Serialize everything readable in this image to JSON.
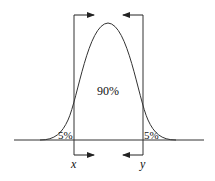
{
  "diagram": {
    "type": "normal-distribution-interval",
    "center_label": "90%",
    "left_tail_label": "5%",
    "right_tail_label": "5%",
    "left_bound_label": "x",
    "right_bound_label": "y",
    "line_color": "#222222"
  }
}
